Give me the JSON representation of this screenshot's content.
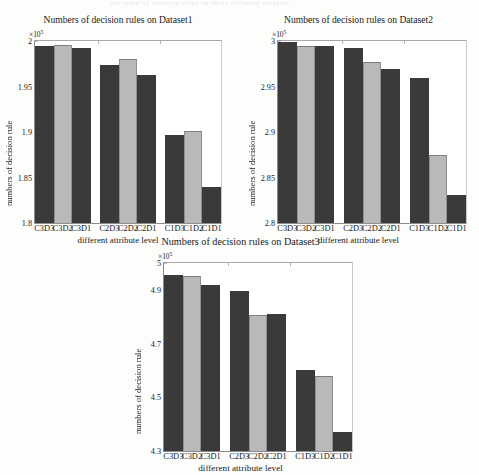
{
  "figure": {
    "bleed_text": "the tenth of decision rules on three different datasets",
    "xlabel": "different attribute level",
    "ylabel": "numbers of decision rule",
    "exponent_prefix": "×10",
    "exponent_power": "5",
    "colors": {
      "bar_dark": "#3a3a3a",
      "bar_light": "#b9b9b9",
      "axis": "#8d8d8d",
      "background": "#fdfdfb"
    }
  },
  "chart_data": [
    {
      "type": "bar",
      "title": "Numbers of decision rules on Dataset1",
      "xlabel": "different attribute level",
      "ylabel": "numbers of decision rule",
      "y_multiplier": "×10^5",
      "ylim": [
        1.8,
        2.0
      ],
      "yticks": [
        "1.8",
        "1.85",
        "1.9",
        "1.95",
        "2"
      ],
      "ytick_values": [
        1.8,
        1.85,
        1.9,
        1.95,
        2.0
      ],
      "grid": false,
      "legend": "none",
      "categories": [
        "C3D3",
        "C3D2",
        "C3D1",
        "C2D3",
        "C2D2",
        "C2D1",
        "C1D3",
        "C1D2",
        "C1D1"
      ],
      "values": [
        1.994,
        1.996,
        1.992,
        1.974,
        1.98,
        1.963,
        1.897,
        1.901,
        1.84
      ],
      "bar_shades": [
        "dark",
        "light",
        "dark",
        "dark",
        "light",
        "dark",
        "dark",
        "light",
        "dark"
      ]
    },
    {
      "type": "bar",
      "title": "Numbers of decision rules on Dataset2",
      "xlabel": "different attribute level",
      "ylabel": "numbers of decision rule",
      "y_multiplier": "×10^5",
      "ylim": [
        2.8,
        3.0
      ],
      "yticks": [
        "2.8",
        "2.85",
        "2.9",
        "2.95",
        "3"
      ],
      "ytick_values": [
        2.8,
        2.85,
        2.9,
        2.95,
        3.0
      ],
      "grid": false,
      "legend": "none",
      "categories": [
        "C3D3",
        "C3D2",
        "C3D1",
        "C2D3",
        "C2D2",
        "C2D1",
        "C1D3",
        "C1D2",
        "C1D1"
      ],
      "values": [
        2.999,
        2.995,
        2.994,
        2.992,
        2.977,
        2.969,
        2.959,
        2.875,
        2.831
      ],
      "bar_shades": [
        "dark",
        "light",
        "dark",
        "dark",
        "light",
        "dark",
        "dark",
        "light",
        "dark"
      ]
    },
    {
      "type": "bar",
      "title": "Numbers of decision rules on Dataset3",
      "xlabel": "different attribute level",
      "ylabel": "numbers of decision rule",
      "y_multiplier": "×10^5",
      "ylim": [
        4.3,
        5.0
      ],
      "yticks": [
        "4.3",
        "4.5",
        "4.7",
        "4.9",
        "5"
      ],
      "ytick_values": [
        4.3,
        4.5,
        4.7,
        4.9,
        5.0
      ],
      "grid": false,
      "legend": "none",
      "categories": [
        "C3D3",
        "C3D2",
        "C3D1",
        "C2D3",
        "C2D2",
        "C2D1",
        "C1D3",
        "C1D2",
        "C1D1"
      ],
      "values": [
        4.957,
        4.953,
        4.919,
        4.895,
        4.806,
        4.811,
        4.6,
        4.58,
        4.37
      ],
      "bar_shades": [
        "dark",
        "light",
        "dark",
        "dark",
        "light",
        "dark",
        "dark",
        "light",
        "dark"
      ]
    }
  ]
}
